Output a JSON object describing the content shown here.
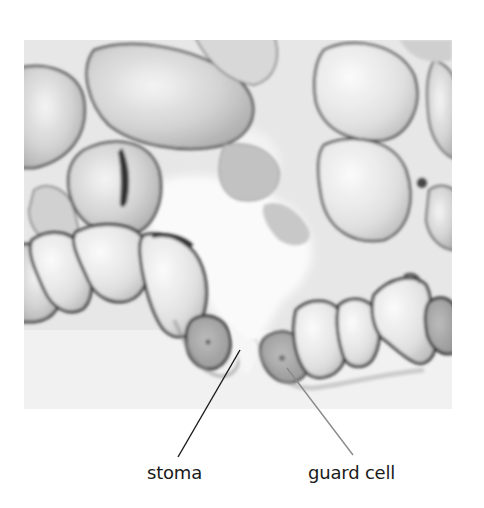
{
  "figure": {
    "image_style": "grayscale",
    "labels": [
      {
        "id": "stoma",
        "text": "stoma",
        "leader_color": "#1a1a1a"
      },
      {
        "id": "guard-cell",
        "text": "guard cell",
        "leader_color": "#8a8a8a"
      }
    ]
  },
  "colors": {
    "background": "#ffffff",
    "cell_wall": "#3a3a3a",
    "cell_fill_light": "#f2f2f2",
    "cell_fill_mid": "#c8c8c8",
    "stoma_pore": "#f7f7f7"
  }
}
